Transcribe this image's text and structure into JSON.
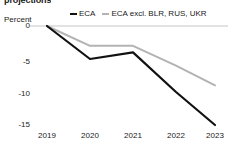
{
  "title": "projections",
  "axis": {
    "ylabel": "Percent",
    "yticks": [
      "0",
      "-5",
      "-10",
      "-15"
    ],
    "xticks": [
      "2019",
      "2020",
      "2021",
      "2022",
      "2023"
    ]
  },
  "legend": [
    {
      "label": "ECA",
      "color": "#111111",
      "name": "legend-eca"
    },
    {
      "label": "ECA excl. BLR, RUS, UKR",
      "color": "#b3b3b3",
      "name": "legend-eca-excl"
    }
  ],
  "chart_data": {
    "type": "line",
    "title": "projections",
    "xlabel": "",
    "ylabel": "Percent",
    "x": [
      2019,
      2020,
      2021,
      2022,
      2023
    ],
    "categories": [
      "2019",
      "2020",
      "2021",
      "2022",
      "2023"
    ],
    "ylim": [
      -16,
      0.5
    ],
    "yticks": [
      0,
      -5,
      -10,
      -15
    ],
    "grid": false,
    "legend_position": "top",
    "series": [
      {
        "name": "ECA",
        "color": "#111111",
        "width": 2.2,
        "values": [
          0,
          -5.0,
          -4.0,
          -10.0,
          -15.0
        ]
      },
      {
        "name": "ECA excl. BLR, RUS, UKR",
        "color": "#b3b3b3",
        "width": 2.0,
        "values": [
          0,
          -3.0,
          -3.0,
          -6.0,
          -9.0
        ]
      }
    ]
  }
}
